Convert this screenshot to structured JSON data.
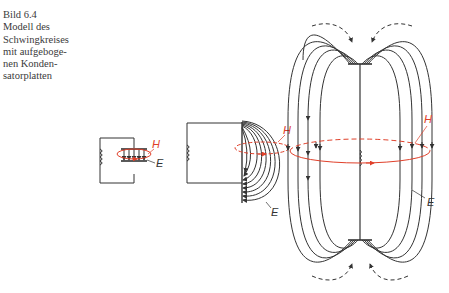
{
  "caption": {
    "figure_number": "Bild 6.4",
    "lines": [
      "Modell des",
      "Schwingkreises",
      "mit aufgebo­ge-",
      "nen Konden-",
      "satorplatten"
    ]
  },
  "labels": {
    "magnetic_field": "H",
    "electric_field": "E"
  },
  "colors": {
    "line": "#333333",
    "magnetic": "#e0402a",
    "caption_text": "#3a3a3a"
  },
  "stages": [
    {
      "name": "closed-capacitor",
      "description": "LC circuit with parallel-plate capacitor"
    },
    {
      "name": "bent-plates",
      "description": "Capacitor plates bent open, E-field arcs"
    },
    {
      "name": "open-dipole",
      "description": "Fully opened plates forming a dipole with outward radiating field"
    }
  ]
}
